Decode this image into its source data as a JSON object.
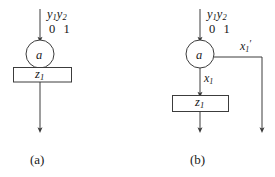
{
  "figure": {
    "type": "state-transition-diagram",
    "background_color": "#ffffff",
    "stroke_color": "#3c3c3c",
    "text_color": "#141414"
  },
  "panels": [
    {
      "id": "a",
      "caption": "(a)",
      "input_label": {
        "signals": "y1y2",
        "signal_text": "y",
        "sub1": "1",
        "sub2": "2",
        "values": "0  1"
      },
      "state_node": {
        "label": "a",
        "shape": "circle"
      },
      "output_box": {
        "label": "z",
        "sub": "1",
        "shape": "rectangle"
      }
    },
    {
      "id": "b",
      "caption": "(b)",
      "input_label": {
        "signals": "y1y2",
        "signal_text": "y",
        "sub1": "1",
        "sub2": "2",
        "values": "0  1"
      },
      "state_node": {
        "label": "a",
        "shape": "circle"
      },
      "branch_label": {
        "text": "x",
        "sub": "1",
        "prime": "′"
      },
      "down_label": {
        "text": "x",
        "sub": "1"
      },
      "output_box": {
        "label": "z",
        "sub": "1",
        "shape": "rectangle"
      }
    }
  ]
}
